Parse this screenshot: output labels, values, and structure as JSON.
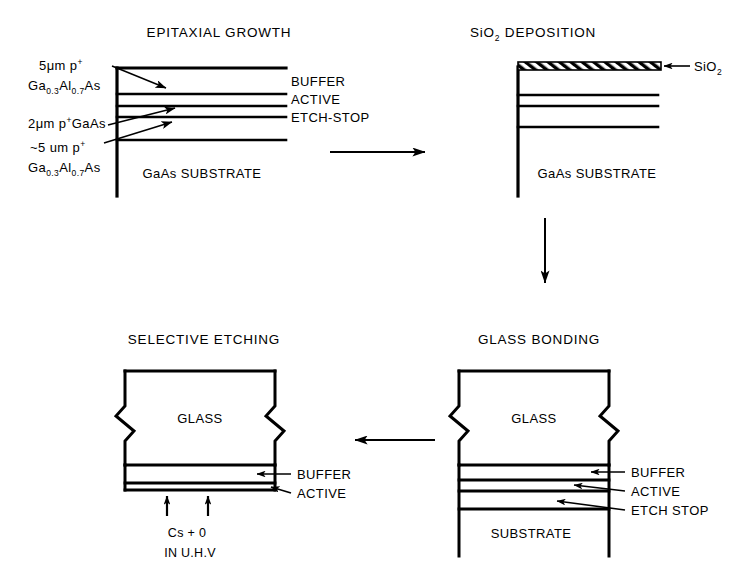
{
  "figure": {
    "name": "photocathode-fabrication-process-flow",
    "background": "#ffffff",
    "ink": "#000000",
    "width": 738,
    "height": 571
  },
  "panels": {
    "epitaxial_growth": {
      "title": "EPITAXIAL GROWTH",
      "substrate_label": "GaAs SUBSTRATE",
      "left_labels": [
        {
          "line1": "5μm p",
          "sup1": "+",
          "line2_a": "Ga",
          "sub2_a": "0.3",
          "line2_b": "Al",
          "sub2_b": "0.7",
          "line2_c": "As"
        },
        {
          "line1": "2μm p",
          "sup1": "+",
          "line2_a": "GaAs"
        },
        {
          "line1": "~5 um p",
          "sup1": "+",
          "line2_a": "Ga",
          "sub2_a": "0.3",
          "line2_b": "Al",
          "sub2_b": "0.7",
          "line2_c": "As"
        }
      ],
      "right_labels": [
        "BUFFER",
        "ACTIVE",
        "ETCH-STOP"
      ]
    },
    "sio2_deposition": {
      "title": "SiO DEPOSITION",
      "title_main": "SiO",
      "title_sub": "2",
      "title_rest": " DEPOSITION",
      "substrate_label": "GaAs SUBSTRATE",
      "layer_label_main": "SiO",
      "layer_label_sub": "2"
    },
    "glass_bonding": {
      "title": "GLASS BONDING",
      "block_label": "GLASS",
      "substrate_label": "SUBSTRATE",
      "right_labels": [
        "BUFFER",
        "ACTIVE",
        "ETCH STOP"
      ]
    },
    "selective_etching": {
      "title": "SELECTIVE ETCHING",
      "block_label": "GLASS",
      "right_labels": [
        "BUFFER",
        "ACTIVE"
      ],
      "bottom_caption_line1": "Cs + 0",
      "bottom_caption_line2": "IN U.H.V"
    }
  },
  "flow_arrows": [
    {
      "name": "arrow-epitaxial-to-sio2",
      "direction": "right"
    },
    {
      "name": "arrow-sio2-to-glass-bonding",
      "direction": "down"
    },
    {
      "name": "arrow-glass-bonding-to-selective-etching",
      "direction": "left"
    }
  ]
}
